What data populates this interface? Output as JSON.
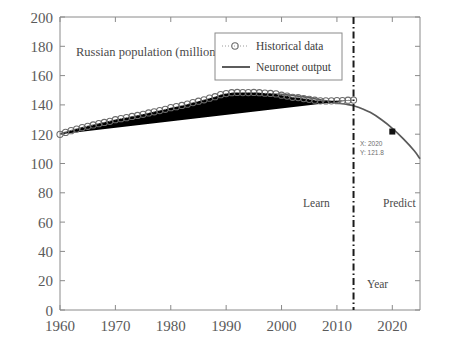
{
  "chart_data": {
    "type": "line",
    "title": "Russian population (million)",
    "xlabel": "Year",
    "ylabel": "",
    "xlim": [
      1960,
      2025
    ],
    "ylim": [
      0,
      200
    ],
    "xticks": [
      1960,
      1970,
      1980,
      1990,
      2000,
      2010,
      2020
    ],
    "yticks": [
      0,
      20,
      40,
      60,
      80,
      100,
      120,
      140,
      160,
      180,
      200
    ],
    "grid": false,
    "legend_position": "top-center",
    "series": [
      {
        "name": "Historical data",
        "style": "dotted-line-with-open-circle-markers",
        "x": [
          1960,
          1961,
          1962,
          1963,
          1964,
          1965,
          1966,
          1967,
          1968,
          1969,
          1970,
          1971,
          1972,
          1973,
          1974,
          1975,
          1976,
          1977,
          1978,
          1979,
          1980,
          1981,
          1982,
          1983,
          1984,
          1985,
          1986,
          1987,
          1988,
          1989,
          1990,
          1991,
          1992,
          1993,
          1994,
          1995,
          1996,
          1997,
          1998,
          1999,
          2000,
          2001,
          2002,
          2003,
          2004,
          2005,
          2006,
          2007,
          2008,
          2009,
          2010,
          2011,
          2012,
          2013
        ],
        "values": [
          119.9,
          121.2,
          122.4,
          123.5,
          124.5,
          125.4,
          126.3,
          127.2,
          128.0,
          128.8,
          129.9,
          130.6,
          131.3,
          132.1,
          132.8,
          133.6,
          134.5,
          135.3,
          136.1,
          137.0,
          138.1,
          138.8,
          139.6,
          140.5,
          141.6,
          142.5,
          143.5,
          144.6,
          145.6,
          147.0,
          147.7,
          148.3,
          148.5,
          148.4,
          148.4,
          148.5,
          148.3,
          148.0,
          147.8,
          147.5,
          146.6,
          146.0,
          145.2,
          145.0,
          144.3,
          143.8,
          143.2,
          142.8,
          142.7,
          142.8,
          142.9,
          143.0,
          143.2,
          143.3
        ]
      },
      {
        "name": "Neuronet output",
        "style": "solid-line",
        "x": [
          1960,
          1962,
          1964,
          1966,
          1968,
          1970,
          1972,
          1974,
          1976,
          1978,
          1980,
          1982,
          1984,
          1986,
          1988,
          1990,
          1992,
          1994,
          1996,
          1998,
          2000,
          2002,
          2004,
          2006,
          2008,
          2010,
          2012,
          2013,
          2014,
          2016,
          2018,
          2020,
          2022,
          2024,
          2025
        ],
        "values": [
          120.2,
          122.3,
          124.3,
          126.1,
          127.8,
          129.4,
          130.9,
          132.4,
          133.9,
          135.4,
          136.9,
          138.4,
          139.9,
          141.4,
          142.9,
          144.3,
          145.6,
          146.6,
          147.2,
          147.4,
          147.2,
          146.5,
          145.5,
          144.2,
          142.8,
          141.4,
          140.2,
          139.4,
          138.2,
          134.9,
          130.0,
          124.0,
          116.8,
          108.5,
          103.2
        ]
      }
    ],
    "annotations": [
      {
        "name": "learn-region-label",
        "text": "Learn",
        "x": 1996,
        "y": 72
      },
      {
        "name": "predict-region-label",
        "text": "Predict",
        "x": 2019,
        "y": 72
      },
      {
        "name": "year-axis-label",
        "text": "Year",
        "x": 2017,
        "y": 20
      },
      {
        "name": "divider-line",
        "text": "",
        "x": 2013,
        "y": null
      }
    ],
    "datatip": {
      "x_label": "X: 2020",
      "y_label": "Y: 121.8",
      "x": 2020,
      "y": 121.8
    }
  },
  "chart": {
    "title_text": "Russian population (million)",
    "legend": {
      "items": [
        {
          "label": "Historical data"
        },
        {
          "label": "Neuronet output"
        }
      ]
    },
    "labels": {
      "learn": "Learn",
      "predict": "Predict",
      "year": "Year"
    },
    "datatip": {
      "line1": "X: 2020",
      "line2": "Y: 121.8"
    },
    "axis": {
      "y_tick_labels": [
        "200",
        "180",
        "160",
        "140",
        "120",
        "100",
        "80",
        "60",
        "40",
        "20",
        "0"
      ],
      "x_tick_labels": [
        "1960",
        "1970",
        "1980",
        "1990",
        "2000",
        "2010",
        "2020"
      ]
    },
    "colors": {
      "axis": "#8a8a8a",
      "line": "#5a5a5a",
      "marker": "#6b6b6b",
      "divider": "#1a1a1a",
      "text": "#4a4a4a",
      "tip": "#111111"
    }
  }
}
